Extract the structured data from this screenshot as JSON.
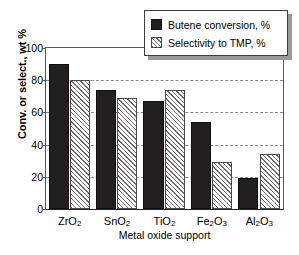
{
  "chart_data": {
    "type": "bar",
    "title": "",
    "xlabel": "Metal oxide support",
    "ylabel": "Conv. or select., wt %",
    "categories": [
      "ZrO2",
      "SnO2",
      "TiO2",
      "Fe2O3",
      "Al2O3"
    ],
    "category_labels_html": [
      "ZrO<sub>2</sub>",
      "SnO<sub>2</sub>",
      "TiO<sub>2</sub>",
      "Fe<sub>2</sub>O<sub>3</sub>",
      "Al<sub>2</sub>O<sub>3</sub>"
    ],
    "series": [
      {
        "name": "Butene conversion, %",
        "style": "solid-black",
        "color": "#231f20",
        "values": [
          90,
          74,
          67,
          54,
          19
        ]
      },
      {
        "name": "Selectivity to TMP, %",
        "style": "diagonal-hatch",
        "color": "#6e6e6e",
        "values": [
          80,
          69,
          74,
          29,
          34
        ]
      }
    ],
    "ylim": [
      0,
      100
    ],
    "yticks": [
      0,
      20,
      40,
      60,
      80,
      100
    ],
    "ytick_labels": [
      "0",
      "20",
      "40",
      "60",
      "80",
      "100"
    ],
    "grid": "horizontal-dashed",
    "legend_position": "top-right-overlapping"
  },
  "legend": {
    "items": [
      {
        "label": "Butene conversion, %"
      },
      {
        "label": "Selectivity to TMP, %"
      }
    ]
  }
}
